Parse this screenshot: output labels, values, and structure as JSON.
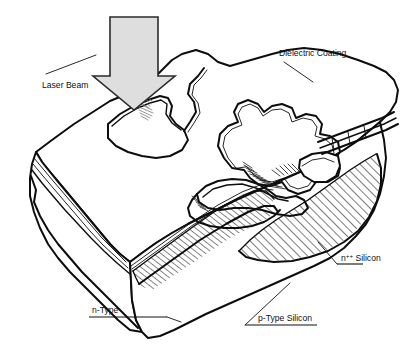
{
  "figure": {
    "background_color": "#ffffff",
    "ink_color": "#0d0d0d",
    "width": 416,
    "height": 348
  },
  "labels": {
    "laser_beam": "Laser Beam",
    "dielectric_coating": "Dielectric Coating",
    "n_plus_plus_silicon_base": "n",
    "n_plus_plus_silicon_sup": "++",
    "n_plus_plus_silicon_tail": " Silicon",
    "n_type": "n-Type",
    "p_type_silicon": "p-Type Silicon"
  },
  "elements": {
    "arrow": {
      "name": "laser-beam-arrow",
      "direction": "down",
      "fill_color": "#dedede",
      "stroke_color": "#2b2b2b"
    },
    "hatch_region": {
      "name": "n-plus-plus-hatch",
      "pattern": "diagonal-lines",
      "angle_deg": 45,
      "stroke_color": "#0d0d0d"
    },
    "ablation_marks": [
      {
        "name": "ablation-spot-top-left",
        "color": "#8a8a8a"
      },
      {
        "name": "ablation-spot-groove",
        "color": "#3a3a3a"
      }
    ],
    "block": {
      "name": "silicon-block",
      "faces": [
        "top",
        "left",
        "front-right"
      ],
      "coating_layer_lines": 3
    }
  }
}
